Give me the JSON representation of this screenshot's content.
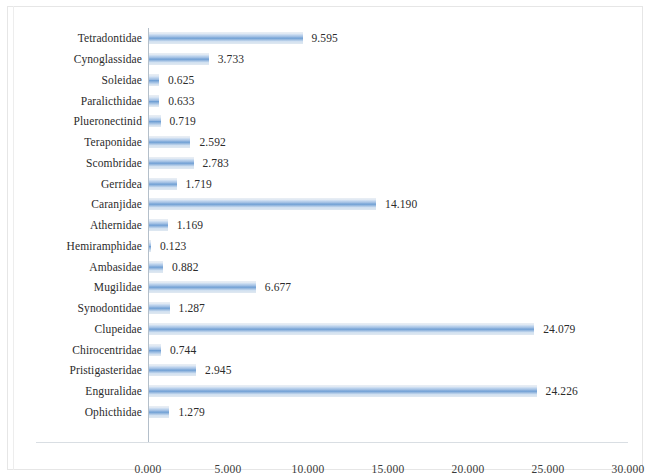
{
  "chart_data": {
    "type": "bar",
    "orientation": "horizontal",
    "title": "",
    "subtitle": "",
    "xlabel": "",
    "ylabel": "",
    "xlim": [
      0,
      30
    ],
    "xtick_step": 5,
    "grid": false,
    "legend": null,
    "legend_position": "none",
    "value_label_format": "0.000",
    "bar_color": "#7ba7d7",
    "axis_color": "#b4bfca",
    "text_color": "#2b2b2b",
    "xticks": [
      "0.000",
      "5.000",
      "10.000",
      "15.000",
      "20.000",
      "25.000",
      "30.000"
    ],
    "xtick_values": [
      0,
      5,
      10,
      15,
      20,
      25,
      30
    ],
    "categories": [
      "Tetradontidae",
      "Cynoglassidae",
      "Soleidae",
      "Paralicthidae",
      "Plueronectinid",
      "Teraponidae",
      "Scombridae",
      "Gerridea",
      "Caranjidae",
      "Athernidae",
      "Hemiramphidae",
      "Ambasidae",
      "Mugilidae",
      "Synodontidae",
      "Clupeidae",
      "Chirocentridae",
      "Pristigasteridae",
      "Enguralidae",
      "Ophicthidae"
    ],
    "values": [
      9.595,
      3.733,
      0.625,
      0.633,
      0.719,
      2.592,
      2.783,
      1.719,
      14.19,
      1.169,
      0.123,
      0.882,
      6.677,
      1.287,
      24.079,
      0.744,
      2.945,
      24.226,
      1.279
    ],
    "value_labels": [
      "9.595",
      "3.733",
      "0.625",
      "0.633",
      "0.719",
      "2.592",
      "2.783",
      "1.719",
      "14.190",
      "1.169",
      "0.123",
      "0.882",
      "6.677",
      "1.287",
      "24.079",
      "0.744",
      "2.945",
      "24.226",
      "1.279"
    ]
  }
}
